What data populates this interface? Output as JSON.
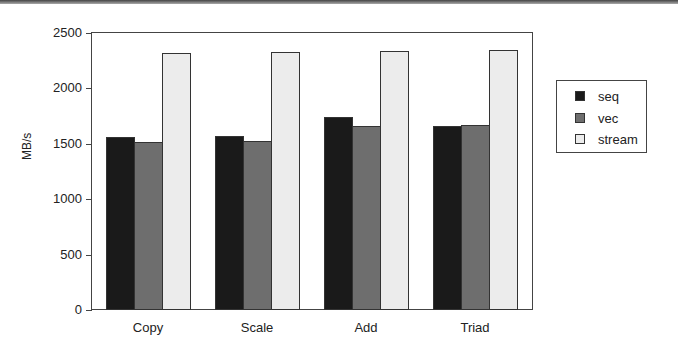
{
  "chart_data": {
    "type": "bar",
    "title": "",
    "xlabel": "",
    "ylabel": "MB/s",
    "ylim": [
      0,
      2500
    ],
    "yticks": [
      0,
      500,
      1000,
      1500,
      2000,
      2500
    ],
    "categories": [
      "Copy",
      "Scale",
      "Add",
      "Triad"
    ],
    "series": [
      {
        "name": "seq",
        "color": "#1a1a1a",
        "values": [
          1560,
          1570,
          1740,
          1660
        ]
      },
      {
        "name": "vec",
        "color": "#6e6e6e",
        "values": [
          1515,
          1525,
          1660,
          1670
        ]
      },
      {
        "name": "stream",
        "color": "#ececec",
        "values": [
          2320,
          2330,
          2340,
          2350
        ]
      }
    ],
    "grid": false,
    "legend_position": "right"
  },
  "axis": {
    "ylabel": "MB/s",
    "yticks": [
      "0",
      "500",
      "1000",
      "1500",
      "2000",
      "2500"
    ]
  },
  "legend": {
    "items": [
      "seq",
      "vec",
      "stream"
    ]
  }
}
